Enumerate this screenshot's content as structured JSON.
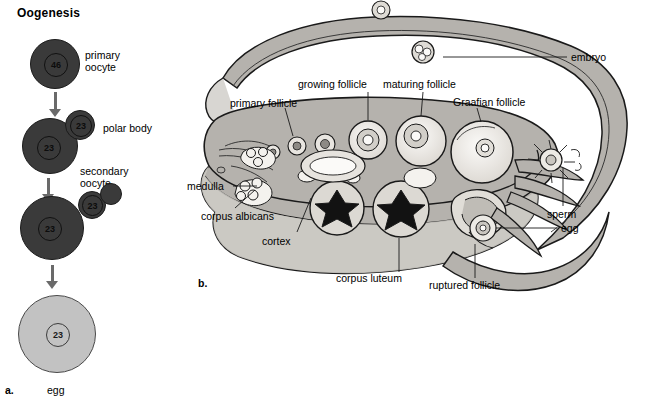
{
  "figure": {
    "panel_a": {
      "letter": "a.",
      "title": "Oogenesis",
      "stages": [
        {
          "id": "primary-oocyte",
          "label": "primary\noocyte",
          "chromosomes": "46",
          "shade": "dark"
        },
        {
          "id": "secondary-oocyte",
          "label": "secondary\noocyte",
          "chromosomes": "23",
          "shade": "dark"
        },
        {
          "id": "ootid",
          "label": "",
          "chromosomes": "23",
          "shade": "dark"
        },
        {
          "id": "egg",
          "label": "egg",
          "chromosomes": "23",
          "shade": "light"
        }
      ],
      "polar_bodies": [
        {
          "chromosomes": "23",
          "label": "polar body"
        },
        {
          "chromosomes": "23",
          "label": ""
        },
        {
          "chromosomes": "",
          "label": ""
        }
      ],
      "labels": {
        "primary_oocyte_line1": "primary",
        "primary_oocyte_line2": "oocyte",
        "polar_body": "polar body",
        "secondary_oocyte_line1": "secondary",
        "secondary_oocyte_line2": "oocyte",
        "egg": "egg"
      },
      "colors": {
        "dark_cell": "#3a3a3a",
        "light_cell": "#c2c2c2",
        "arrow": "#6a6a6a"
      }
    },
    "panel_b": {
      "letter": "b.",
      "labels": [
        {
          "id": "primary-follicle",
          "text": "primary follicle"
        },
        {
          "id": "growing-follicle",
          "text": "growing follicle"
        },
        {
          "id": "maturing-follicle",
          "text": "maturing follicle"
        },
        {
          "id": "graafian-follicle",
          "text": "Graafian follicle"
        },
        {
          "id": "embryo",
          "text": "embryo"
        },
        {
          "id": "sperm",
          "text": "sperm"
        },
        {
          "id": "egg",
          "text": "egg"
        },
        {
          "id": "ruptured-follicle",
          "text": "ruptured follicle"
        },
        {
          "id": "corpus-luteum",
          "text": "corpus luteum"
        },
        {
          "id": "cortex",
          "text": "cortex"
        },
        {
          "id": "corpus-albicans",
          "text": "corpus albicans"
        },
        {
          "id": "medulla",
          "text": "medulla"
        }
      ],
      "colors": {
        "tissue": "#b5b2ad",
        "tube_lumen": "#d8d6d2",
        "outline": "#1a1a1a",
        "follicle_fill": "#f2f0ec"
      }
    }
  }
}
